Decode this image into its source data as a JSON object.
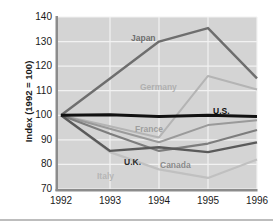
{
  "chart_data": {
    "type": "line",
    "title": "",
    "subtitle": "",
    "xlabel": "",
    "ylabel": "Index (1992 = 100)",
    "x": [
      "1992",
      "1993",
      "1994",
      "1995",
      "1996"
    ],
    "xlim": [
      1992,
      1996
    ],
    "ylim": [
      70,
      140
    ],
    "yticks": [
      70,
      80,
      90,
      100,
      110,
      120,
      130,
      140
    ],
    "grid": "horizontal-and-vertical-white-on-gray",
    "legend": "inline-series-labels",
    "plot_background": "#d4d4d4",
    "gridline_color": "#f2f2f2",
    "series": [
      {
        "name": "Japan",
        "color": "#6e6e6e",
        "width": 2.4,
        "values": [
          100,
          115,
          130,
          135.5,
          115
        ],
        "label_x": 131,
        "label_y": 34,
        "label_color": "#6e6e6e",
        "label_bold": true
      },
      {
        "name": "Germany",
        "color": "#b4b4b4",
        "width": 2.0,
        "values": [
          100,
          95.5,
          91,
          116,
          110.5
        ],
        "label_x": 140,
        "label_y": 83,
        "label_color": "#b0b0b0",
        "label_bold": true
      },
      {
        "name": "U.S.",
        "color": "#111111",
        "width": 3.0,
        "values": [
          100,
          100.2,
          99.5,
          100,
          99.5
        ],
        "label_x": 213,
        "label_y": 107,
        "label_color": "#111111",
        "label_bold": true
      },
      {
        "name": "France",
        "color": "#9a9a9a",
        "width": 2.0,
        "values": [
          100,
          94.5,
          89,
          96,
          98
        ],
        "label_x": 135,
        "label_y": 125,
        "label_color": "#9e9e9e",
        "label_bold": true
      },
      {
        "name": "Canada",
        "color": "#7d7d7d",
        "width": 2.2,
        "values": [
          100,
          92.5,
          85.5,
          88.5,
          94
        ],
        "label_x": 160,
        "label_y": 161,
        "label_color": "#8a8a8a",
        "label_bold": true
      },
      {
        "name": "U.K.",
        "color": "#5a5a5a",
        "width": 2.4,
        "values": [
          100,
          85.5,
          87,
          85,
          89
        ],
        "label_x": 124,
        "label_y": 158,
        "label_color": "#2b2b2b",
        "label_bold": true
      },
      {
        "name": "Italy",
        "color": "#c0c0c0",
        "width": 2.2,
        "values": [
          100,
          85,
          78,
          74.5,
          82
        ],
        "label_x": 97,
        "label_y": 172,
        "label_color": "#b6b6b6",
        "label_bold": true
      }
    ]
  },
  "axis": {
    "y_title": "Index (1992 = 100)",
    "y_labels": [
      "140",
      "130",
      "120",
      "110",
      "100",
      "90",
      "80",
      "70"
    ],
    "x_labels": [
      "1992",
      "1993",
      "1994",
      "1995",
      "1996"
    ]
  }
}
